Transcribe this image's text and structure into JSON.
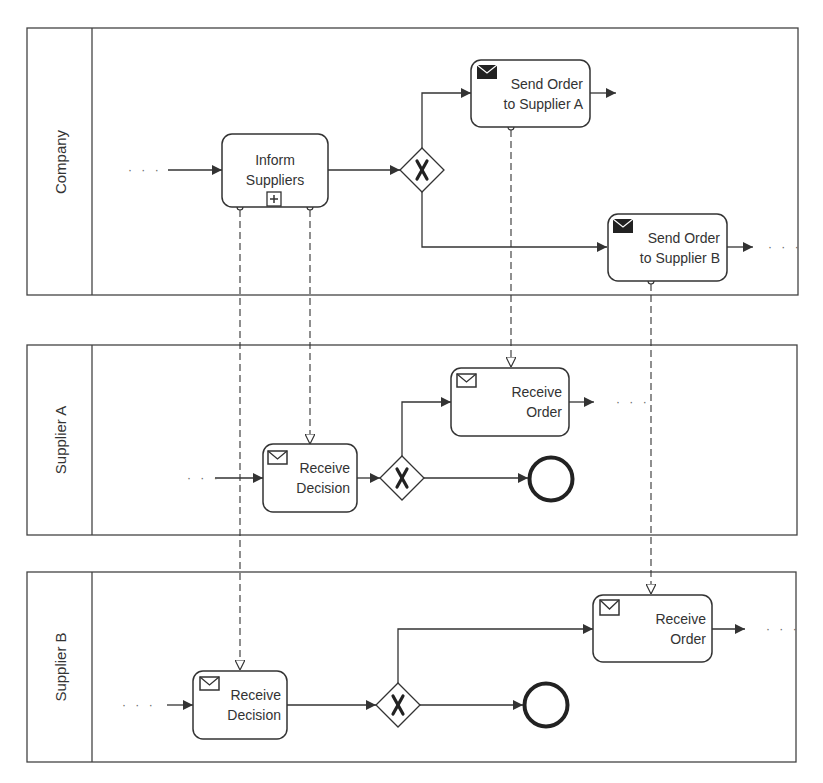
{
  "diagram": {
    "type": "BPMN collaboration",
    "colors": {
      "stroke": "#333333",
      "background": "#ffffff",
      "text": "#333333"
    },
    "pools": [
      {
        "id": "company",
        "label": "Company"
      },
      {
        "id": "supplier_a",
        "label": "Supplier A"
      },
      {
        "id": "supplier_b",
        "label": "Supplier B"
      }
    ],
    "tasks": {
      "inform_suppliers": {
        "line1": "Inform",
        "line2": "Suppliers",
        "marker": "collapsed-subprocess-plus-icon"
      },
      "send_order_a": {
        "line1": "Send Order",
        "line2": "to Supplier A",
        "marker": "send-envelope-filled-icon"
      },
      "send_order_b": {
        "line1": "Send Order",
        "line2": "to Supplier B",
        "marker": "send-envelope-filled-icon"
      },
      "a_receive_decision": {
        "line1": "Receive",
        "line2": "Decision",
        "marker": "receive-envelope-outline-icon"
      },
      "a_receive_order": {
        "line1": "Receive",
        "line2": "Order",
        "marker": "receive-envelope-outline-icon"
      },
      "b_receive_decision": {
        "line1": "Receive",
        "line2": "Decision",
        "marker": "receive-envelope-outline-icon"
      },
      "b_receive_order": {
        "line1": "Receive",
        "line2": "Order",
        "marker": "receive-envelope-outline-icon"
      }
    },
    "gateways": [
      {
        "id": "company_xor",
        "type": "exclusive",
        "symbol": "X"
      },
      {
        "id": "a_xor",
        "type": "exclusive",
        "symbol": "X"
      },
      {
        "id": "b_xor",
        "type": "exclusive",
        "symbol": "X"
      }
    ],
    "end_events": [
      {
        "id": "a_end"
      },
      {
        "id": "b_end"
      }
    ],
    "continuation": "· · ·",
    "message_flows": [
      {
        "from": "inform_suppliers",
        "to": "a_receive_decision"
      },
      {
        "from": "inform_suppliers",
        "to": "b_receive_decision"
      },
      {
        "from": "send_order_a",
        "to": "a_receive_order"
      },
      {
        "from": "send_order_b",
        "to": "b_receive_order"
      }
    ]
  }
}
